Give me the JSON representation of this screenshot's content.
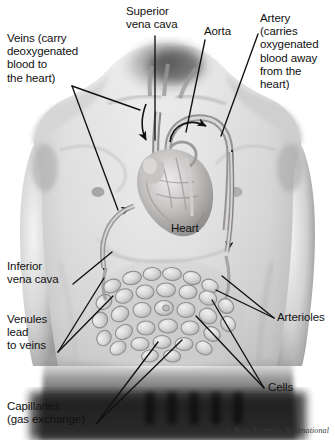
{
  "figure": {
    "copyright": "© Body Scientific International",
    "background_color": "#ffffff",
    "line_color": "#111111",
    "text_color": "#111111"
  },
  "labels": {
    "veins": "Veins (carry\ndeoxygenated\nblood to\nthe heart)",
    "superior_vena_cava": "Superior\nvena cava",
    "aorta": "Aorta",
    "artery": "Artery\n(carries\noxygenated\nblood away\nfrom the\nheart)",
    "heart": "Heart",
    "inferior_vena_cava": "Inferior\nvena cava",
    "venules": "Venules\nlead\nto veins",
    "capillaries": "Capillaries\n(gas exchange)",
    "arterioles": "Arterioles",
    "cells": "Cells"
  }
}
